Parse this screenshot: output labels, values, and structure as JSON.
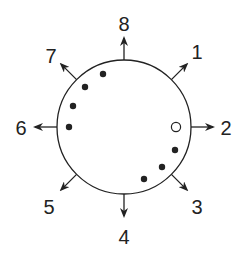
{
  "diagram": {
    "type": "circular-direction-diagram",
    "circle": {
      "cx": 124,
      "cy": 127,
      "r": 67,
      "stroke": "#222222"
    },
    "directions": [
      {
        "label": "1",
        "angle_deg": 45,
        "label_x": 197,
        "label_y": 59
      },
      {
        "label": "2",
        "angle_deg": 0,
        "label_x": 226,
        "label_y": 135
      },
      {
        "label": "3",
        "angle_deg": -45,
        "label_x": 197,
        "label_y": 214
      },
      {
        "label": "4",
        "angle_deg": -90,
        "label_x": 124,
        "label_y": 244
      },
      {
        "label": "5",
        "angle_deg": -135,
        "label_x": 49,
        "label_y": 214
      },
      {
        "label": "6",
        "angle_deg": 180,
        "label_x": 21,
        "label_y": 135
      },
      {
        "label": "7",
        "angle_deg": 135,
        "label_x": 51,
        "label_y": 63
      },
      {
        "label": "8",
        "angle_deg": 90,
        "label_x": 124,
        "label_y": 31
      }
    ],
    "dots": [
      {
        "x": 103,
        "y": 74,
        "filled": true
      },
      {
        "x": 85,
        "y": 87,
        "filled": true
      },
      {
        "x": 73,
        "y": 106,
        "filled": true
      },
      {
        "x": 69,
        "y": 127,
        "filled": true
      },
      {
        "x": 176,
        "y": 127,
        "filled": false
      },
      {
        "x": 175,
        "y": 150,
        "filled": true
      },
      {
        "x": 162,
        "y": 167,
        "filled": true
      },
      {
        "x": 144,
        "y": 179,
        "filled": true
      }
    ],
    "colors": {
      "ink": "#222222",
      "background": "#ffffff"
    }
  }
}
